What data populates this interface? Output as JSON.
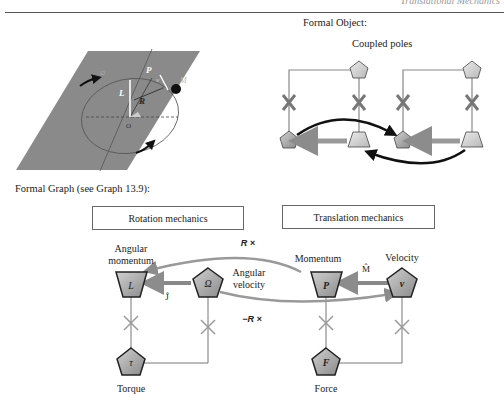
{
  "header": {
    "running_title": "Translational Mechanics"
  },
  "formal_object": {
    "label": "Formal Object:",
    "title": "Coupled poles"
  },
  "physical_figure": {
    "labels": {
      "P": "P",
      "v": "v",
      "M": "M",
      "L": "L",
      "R": "R",
      "O": "O",
      "omega": "Ω"
    }
  },
  "formal_graph": {
    "label": "Formal Graph (see Graph 13.9):",
    "boxes": {
      "rotation": "Rotation mechanics",
      "translation": "Translation mechanics"
    },
    "nodes": {
      "L": {
        "symbol": "L",
        "caption_line1": "Angular",
        "caption_line2": "momentum"
      },
      "Omega": {
        "symbol": "Ω",
        "caption_line1": "Angular",
        "caption_line2": "velocity"
      },
      "tau": {
        "symbol": "τ",
        "caption": "Torque"
      },
      "P": {
        "symbol": "P",
        "caption": "Momentum"
      },
      "v": {
        "symbol": "v",
        "caption": "Velocity"
      },
      "F": {
        "symbol": "F",
        "caption": "Force"
      }
    },
    "operators": {
      "J": "Ĵ",
      "M": "M̂",
      "Rx": "R ×",
      "negRx": "−R ×"
    }
  },
  "colors": {
    "node_fill": "#a8a8a8",
    "node_stroke": "#333333",
    "arrow_grey": "#8c8c8c",
    "arrow_black": "#111111",
    "cross": "#7a7a7a",
    "plane": "#8a8a8a"
  }
}
